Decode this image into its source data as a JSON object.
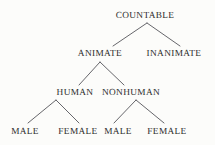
{
  "diagram": {
    "type": "tree",
    "background_color": "#fcfcfa",
    "text_color": "#2b2b2b",
    "line_color": "#55555a",
    "levels": [
      {
        "level": 1,
        "nodes": [
          {
            "id": "countable",
            "label": "COUNTABLE",
            "x": 145,
            "y": 11
          }
        ]
      },
      {
        "level": 2,
        "nodes": [
          {
            "id": "animate",
            "label": "ANIMATE",
            "x": 100,
            "y": 49
          },
          {
            "id": "inanimate",
            "label": "INANIMATE",
            "x": 174,
            "y": 49
          }
        ]
      },
      {
        "level": 3,
        "nodes": [
          {
            "id": "human",
            "label": "HUMAN",
            "x": 75,
            "y": 88
          },
          {
            "id": "nonhuman",
            "label": "NONHUMAN",
            "x": 131,
            "y": 88
          }
        ]
      },
      {
        "level": 4,
        "nodes": [
          {
            "id": "human-male",
            "label": "MALE",
            "x": 25,
            "y": 127
          },
          {
            "id": "human-female",
            "label": "FEMALE",
            "x": 78,
            "y": 127
          },
          {
            "id": "nonhuman-male",
            "label": "MALE",
            "x": 118,
            "y": 127
          },
          {
            "id": "nonhuman-female",
            "label": "FEMALE",
            "x": 167,
            "y": 127
          }
        ]
      }
    ],
    "edges": [
      {
        "id": "edge-countable-animate",
        "from": "countable",
        "to": "animate",
        "x1": 147,
        "y1": 23,
        "x2": 113,
        "y2": 46
      },
      {
        "id": "edge-countable-inanimate",
        "from": "countable",
        "to": "inanimate",
        "x1": 147,
        "y1": 23,
        "x2": 180,
        "y2": 46
      },
      {
        "id": "edge-animate-human",
        "from": "animate",
        "to": "human",
        "x1": 100,
        "y1": 62,
        "x2": 79,
        "y2": 85
      },
      {
        "id": "edge-animate-nonhuman",
        "from": "animate",
        "to": "nonhuman",
        "x1": 100,
        "y1": 62,
        "x2": 124,
        "y2": 85
      },
      {
        "id": "edge-human-male",
        "from": "human",
        "to": "human-male",
        "x1": 56,
        "y1": 100,
        "x2": 28,
        "y2": 123
      },
      {
        "id": "edge-human-female",
        "from": "human",
        "to": "human-female",
        "x1": 56,
        "y1": 100,
        "x2": 79,
        "y2": 123
      },
      {
        "id": "edge-nonhuman-male",
        "from": "nonhuman",
        "to": "nonhuman-male",
        "x1": 136,
        "y1": 100,
        "x2": 114,
        "y2": 123
      },
      {
        "id": "edge-nonhuman-female",
        "from": "nonhuman",
        "to": "nonhuman-female",
        "x1": 136,
        "y1": 100,
        "x2": 164,
        "y2": 123
      }
    ]
  }
}
